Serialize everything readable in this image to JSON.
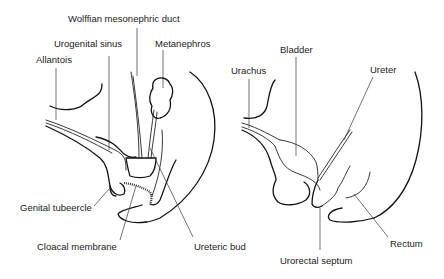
{
  "figure": {
    "left_panel": {
      "labels": {
        "wolffian": "Wolffian mesonephric duct",
        "urogenital_sinus": "Urogenital sinus",
        "metanephros": "Metanephros",
        "allantois": "Allantois",
        "genital_tubercle": "Genital tubeercle",
        "cloacal_membrane": "Cloacal membrane",
        "ureteric_bud": "Ureteric bud"
      }
    },
    "right_panel": {
      "labels": {
        "bladder": "Bladder",
        "urachus": "Urachus",
        "ureter": "Ureter",
        "rectum": "Rectum",
        "urorectal_septum": "Urorectal septum"
      }
    },
    "colors": {
      "line": "#111111",
      "background": "#ffffff",
      "text": "#1a1a1a"
    }
  }
}
